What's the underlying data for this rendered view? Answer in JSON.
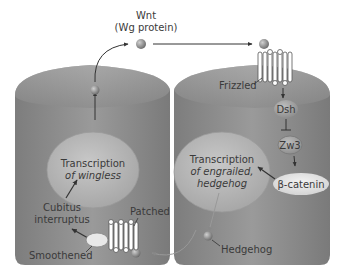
{
  "diagram": {
    "wnt": {
      "line1": "Wnt",
      "line2": "(Wg protein)"
    },
    "left_cell": {
      "nucleus_line1": "Transcription",
      "nucleus_line2": "of wingless",
      "cubitus_line1": "Cubitus",
      "cubitus_line2": "interruptus",
      "patched": "Patched",
      "smoothened": "Smoothened"
    },
    "right_cell": {
      "frizzled": "Frizzled",
      "dsh": "Dsh",
      "zw3": "Zw3",
      "beta_catenin": "β-catenin",
      "nucleus_line1": "Transcription",
      "nucleus_line2": "of engrailed,",
      "nucleus_line3": "hedgehog",
      "hedgehog": "Hedgehog"
    },
    "colors": {
      "cell_fill": "#8e8e8e",
      "cell_top": "#a9a9a9",
      "nucleus_fill": "#b8b8b8",
      "protein_fill": "#9c9c9c",
      "text": "#3a3a3a"
    }
  }
}
